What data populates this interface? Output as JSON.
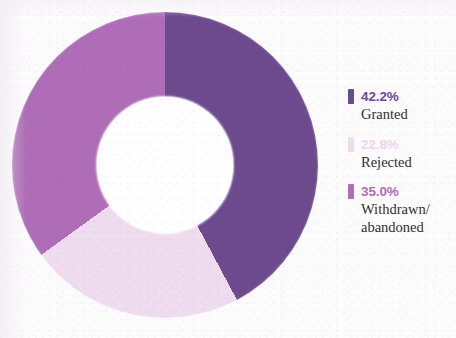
{
  "chart_data": {
    "type": "pie",
    "variant": "donut",
    "title": "",
    "subtitle": "",
    "xlabel": "",
    "ylabel": "",
    "grid": false,
    "legend_position": "right",
    "units": "percent",
    "start_angle_deg": 0,
    "direction": "clockwise",
    "inner_radius_ratio": 0.445,
    "categories": [
      "Granted",
      "Rejected",
      "Withdrawn/\nabandoned"
    ],
    "values": [
      42.2,
      22.8,
      35.0
    ],
    "labels": [
      "42.2%",
      "22.8%",
      "35.0%"
    ],
    "colors": [
      "#6d4a8f",
      "#f0dcf0",
      "#b06cb8"
    ],
    "series": [
      {
        "name": "Share of applications",
        "values": [
          42.2,
          22.8,
          35.0
        ]
      }
    ],
    "slices": [
      {
        "label": "Granted",
        "value": 42.2,
        "value_label": "42.2%",
        "color": "#6d4a8f"
      },
      {
        "label": "Rejected",
        "value": 22.8,
        "value_label": "22.8%",
        "color": "#f0dcf0"
      },
      {
        "label": "Withdrawn/ abandoned",
        "value": 35.0,
        "value_label": "35.0%",
        "color": "#b06cb8"
      }
    ]
  },
  "legend": {
    "items": [
      {
        "pct": "42.2%",
        "label_line1": "Granted",
        "label_line2": "",
        "color": "#6d4a8f",
        "pct_color": "#6d4a8f"
      },
      {
        "pct": "22.8%",
        "label_line1": "Rejected",
        "label_line2": "",
        "color": "#f0dcf0",
        "pct_color": "#f0d4ee"
      },
      {
        "pct": "35.0%",
        "label_line1": "Withdrawn/",
        "label_line2": "abandoned",
        "color": "#b06cb8",
        "pct_color": "#b06cb8"
      }
    ]
  },
  "theme": {
    "background": "#fdfcfd",
    "hole": "#ffffff",
    "text": "#2f2c30",
    "accent_dark": "#6d4a8f",
    "accent_mid": "#b06cb8",
    "accent_light": "#f0dcf0"
  }
}
